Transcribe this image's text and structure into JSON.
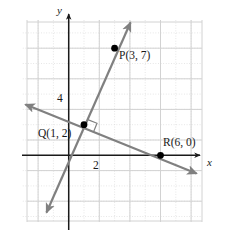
{
  "figure": {
    "name": "coordinate-plane-perpendicular-lines",
    "background_color": "#ffffff",
    "grid": {
      "minor_color": "#d9d9d9",
      "major_color": "#d0d0d0",
      "minor_style": "dotted",
      "major_style": "solid",
      "visible": true,
      "x_range": [
        -3,
        9
      ],
      "y_range": [
        -5,
        9
      ],
      "spacing_units": 1,
      "major_every": 2
    },
    "axes": {
      "x_label": "x",
      "y_label": "y",
      "color": "#1a1a1a",
      "x_tick_label": "2",
      "y_tick_label": "4"
    },
    "lines": [
      {
        "id": "line-PQ",
        "label": "line through Q(1, 2) and P(3, 7)",
        "color": "#808080",
        "slope": 2.5,
        "through": [
          [
            1,
            2
          ],
          [
            3,
            7
          ]
        ],
        "arrows": "both"
      },
      {
        "id": "line-QR",
        "label": "line through Q(1, 2) and R(6, 0)",
        "color": "#808080",
        "slope": -0.4,
        "through": [
          [
            1,
            2
          ],
          [
            6,
            0
          ]
        ],
        "arrows": "both"
      }
    ],
    "right_angle_marker": {
      "at": [
        1,
        2
      ],
      "label": "right-angle-mark",
      "visible": true,
      "color": "#808080"
    },
    "points": [
      {
        "id": "point-P",
        "name": "P",
        "x": 3,
        "y": 7,
        "label": "P(3, 7)",
        "color": "#000000"
      },
      {
        "id": "point-Q",
        "name": "Q",
        "x": 1,
        "y": 2,
        "label": "Q(1, 2)",
        "color": "#000000"
      },
      {
        "id": "point-R",
        "name": "R",
        "x": 6,
        "y": 0,
        "label": "R(6, 0)",
        "color": "#000000"
      }
    ]
  }
}
